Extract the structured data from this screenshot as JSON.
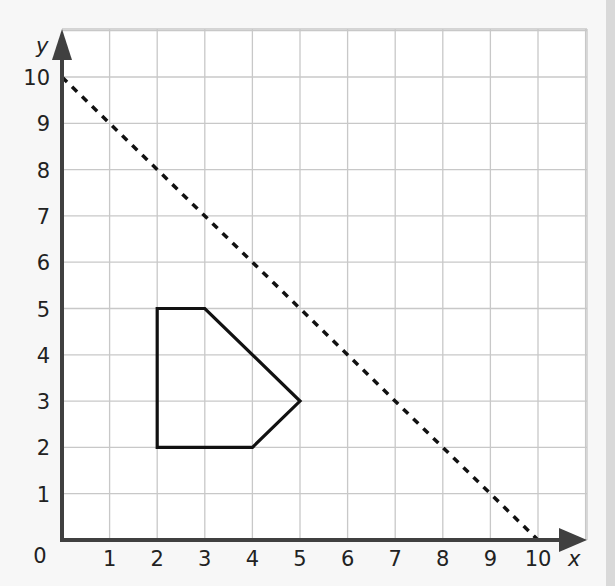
{
  "chart_data": {
    "type": "line",
    "title": "",
    "xlabel": "x",
    "ylabel": "y",
    "xlim": [
      0,
      11
    ],
    "ylim": [
      0,
      11
    ],
    "grid": true,
    "origin_label": "0",
    "x_ticks": [
      "1",
      "2",
      "3",
      "4",
      "5",
      "6",
      "7",
      "8",
      "9",
      "10"
    ],
    "y_ticks": [
      "1",
      "2",
      "3",
      "4",
      "5",
      "6",
      "7",
      "8",
      "9",
      "10"
    ],
    "series": [
      {
        "name": "dashed-line",
        "style": "dotted",
        "points": [
          [
            0,
            10
          ],
          [
            10,
            0
          ]
        ]
      },
      {
        "name": "polygon",
        "style": "solid",
        "closed": true,
        "points": [
          [
            2,
            2
          ],
          [
            2,
            5
          ],
          [
            3,
            5
          ],
          [
            5,
            3
          ],
          [
            4,
            2
          ]
        ]
      }
    ]
  },
  "colors": {
    "axis": "#404040",
    "grid": "#c8c8c8",
    "shape": "#111111",
    "background": "#ffffff"
  }
}
